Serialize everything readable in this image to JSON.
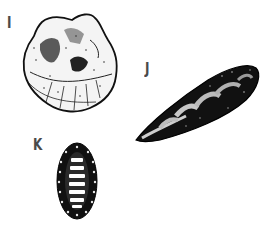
{
  "figure": {
    "specimens": [
      {
        "label": "I",
        "name": "oyster-shell"
      },
      {
        "label": "J",
        "name": "mussel-shell"
      },
      {
        "label": "K",
        "name": "chiton-shell"
      }
    ]
  }
}
